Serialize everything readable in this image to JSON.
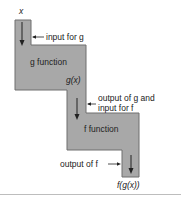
{
  "diagram": {
    "input_label": "x",
    "input_annotation": "input for g",
    "g_box_label": "g function",
    "g_output_label": "g(x)",
    "middle_annotation_line1": "output of g and",
    "middle_annotation_line2": "input for f",
    "f_box_label": "f function",
    "f_output_annotation": "output of f",
    "final_output_label": "f(g(x))",
    "colors": {
      "box_fill": "#a8a8a8",
      "box_stroke": "#6e6e6e",
      "arrow": "#222222",
      "rule": "#bdbdbd"
    }
  }
}
